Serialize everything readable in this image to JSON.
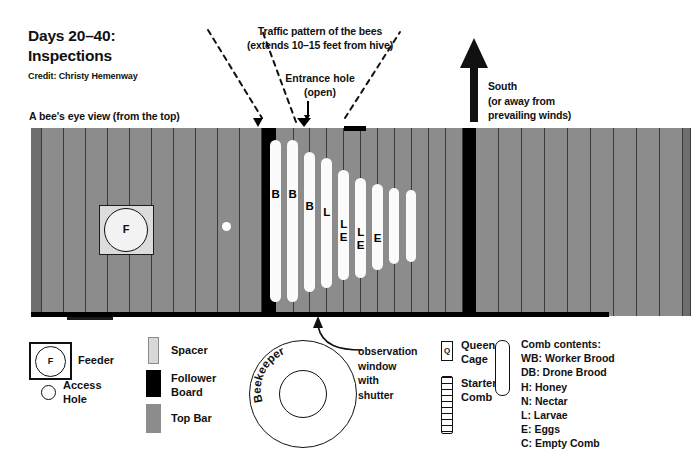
{
  "title": {
    "line1": "Days 20–40:",
    "line2": "Inspections",
    "credit": "Credit: Christy Hemenway"
  },
  "labels": {
    "bee_eye_view": "A bee's eye view (from the top)",
    "traffic_line1": "Traffic pattern of the bees",
    "traffic_line2": "(extends 10–15 feet from hive)",
    "entrance_line1": "Entrance hole",
    "entrance_line2": "(open)",
    "south_line1": "South",
    "south_line2": "(or away from",
    "south_line3": "prevailing winds)",
    "observation_line1": "observation",
    "observation_line2": "window",
    "observation_line3": "with",
    "observation_line4": "shutter",
    "beekeeper": "Beekeeper"
  },
  "hive": {
    "feeder_letter": "F",
    "comb_letters": [
      "B",
      "B",
      "B",
      "L",
      "L\nE",
      "L\nE",
      "E",
      "",
      ""
    ]
  },
  "legend_left": {
    "feeder_letter": "F",
    "feeder_label": "Feeder",
    "access_label_line1": "Access",
    "access_label_line2": "Hole",
    "spacer_label": "Spacer",
    "follower_label_line1": "Follower",
    "follower_label_line2": "Board",
    "topbar_label": "Top Bar"
  },
  "legend_right": {
    "queen_cage_letter": "Q",
    "queen_cage_line1": "Queen",
    "queen_cage_line2": "Cage",
    "starter_comb_line1": "Starter",
    "starter_comb_line2": "Comb",
    "comb_contents_title": "Comb contents:",
    "comb_contents": [
      "WB: Worker Brood",
      "DB: Drone Brood",
      "H: Honey",
      "N: Nectar",
      "L: Larvae",
      "E: Eggs",
      "C: Empty Comb"
    ]
  },
  "colors": {
    "top_bar": "#8c8c8c",
    "follower_board": "#000000",
    "spacer": "#d8d8d8",
    "comb": "#fbfbfb",
    "end_cap": "#6e6e6e",
    "background": "#ffffff"
  }
}
